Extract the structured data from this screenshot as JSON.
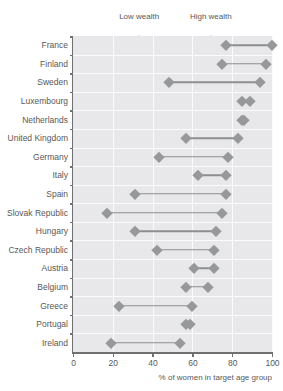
{
  "chart_data": {
    "type": "dumbbell",
    "title": "",
    "xlabel": "% of women in target age group",
    "ylabel": "",
    "xlim": [
      0,
      100
    ],
    "xticks": [
      0,
      20,
      40,
      60,
      80,
      100
    ],
    "xticklabels": [
      "0",
      "20",
      "40",
      "60",
      "80",
      "100"
    ],
    "grid": "vertical",
    "legend_position": "top",
    "legend": [
      {
        "name": "Low wealth",
        "value": 33
      },
      {
        "name": "High wealth",
        "value": 69
      }
    ],
    "categories": [
      "France",
      "Finland",
      "Sweden",
      "Luxembourg",
      "Netherlands",
      "United Kingdom",
      "Germany",
      "Italy",
      "Spain",
      "Slovak Republic",
      "Hungary",
      "Czech Republic",
      "Austria",
      "Belgium",
      "Greece",
      "Portugal",
      "Ireland"
    ],
    "series": [
      {
        "name": "Low wealth",
        "values": [
          77,
          75,
          48,
          85,
          85,
          57,
          43,
          63,
          31,
          17,
          31,
          42,
          61,
          57,
          23,
          57,
          19
        ]
      },
      {
        "name": "High wealth",
        "values": [
          100,
          97,
          94,
          89,
          86,
          83,
          78,
          77,
          77,
          75,
          72,
          71,
          71,
          68,
          60,
          59,
          54
        ]
      }
    ],
    "colors": {
      "marker": "#97989a",
      "connector": "#8d8e90",
      "plot_background": "#e8e8ea",
      "gridline": "#fbfbfc",
      "axis": "#6f7072",
      "text": "#58585a"
    }
  }
}
